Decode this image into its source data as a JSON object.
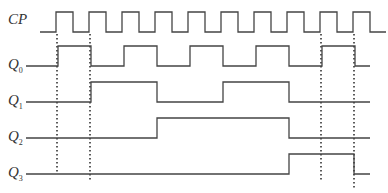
{
  "diagram": {
    "type": "timing-diagram",
    "colors": {
      "line": "#444444",
      "dots": "#333333",
      "background": "#ffffff"
    },
    "signals": [
      {
        "name": "CP",
        "label_main": "CP",
        "label_sub": "",
        "label_x": 8,
        "label_y": 12,
        "y_high": 12,
        "y_low": 32,
        "x_start": 40,
        "x_end": 386,
        "transitions": [
          56,
          73,
          89,
          106,
          122,
          139,
          155,
          172,
          188,
          205,
          221,
          238,
          254,
          271,
          287,
          304,
          320,
          337,
          353,
          370
        ],
        "initial": "low"
      },
      {
        "name": "Q0",
        "label_main": "Q",
        "label_sub": "0",
        "label_x": 8,
        "label_y": 57,
        "y_high": 46,
        "y_low": 66,
        "x_start": 26,
        "x_end": 370,
        "transitions": [
          58,
          91,
          124,
          157,
          190,
          223,
          256,
          289,
          322,
          355
        ],
        "initial": "low"
      },
      {
        "name": "Q1",
        "label_main": "Q",
        "label_sub": "1",
        "label_x": 8,
        "label_y": 93,
        "y_high": 82,
        "y_low": 102,
        "x_start": 26,
        "x_end": 370,
        "transitions": [
          91,
          157,
          223,
          289
        ],
        "initial": "low"
      },
      {
        "name": "Q2",
        "label_main": "Q",
        "label_sub": "2",
        "label_x": 8,
        "label_y": 129,
        "y_high": 118,
        "y_low": 138,
        "x_start": 26,
        "x_end": 370,
        "transitions": [
          157,
          289
        ],
        "initial": "low"
      },
      {
        "name": "Q3",
        "label_main": "Q",
        "label_sub": "3",
        "label_x": 8,
        "label_y": 165,
        "y_high": 154,
        "y_low": 174,
        "x_start": 26,
        "x_end": 370,
        "transitions": [
          289,
          354
        ],
        "initial": "low"
      }
    ],
    "dotted_guides": [
      {
        "x": 57,
        "y1": 34,
        "y2": 172
      },
      {
        "x": 90,
        "y1": 34,
        "y2": 182
      },
      {
        "x": 321,
        "y1": 34,
        "y2": 180
      },
      {
        "x": 354,
        "y1": 34,
        "y2": 190
      }
    ]
  }
}
